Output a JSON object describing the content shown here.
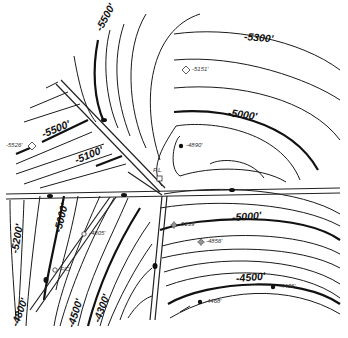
{
  "map": {
    "type": "structure contour map",
    "contour_labels": [
      {
        "id": "c5500-top",
        "text": "-5500'",
        "x": 98,
        "y": 30,
        "rot": -62
      },
      {
        "id": "c5300",
        "text": "-5300'",
        "x": 244,
        "y": 36,
        "rot": 5
      },
      {
        "id": "c5000-top",
        "text": "-5000'",
        "x": 228,
        "y": 112,
        "rot": 8
      },
      {
        "id": "c5500-left",
        "text": "-5500'",
        "x": 42,
        "y": 134,
        "rot": -22
      },
      {
        "id": "c5100",
        "text": "-5100'",
        "x": 75,
        "y": 160,
        "rot": -22
      },
      {
        "id": "c5200",
        "text": "-5200'",
        "x": 14,
        "y": 253,
        "rot": -80
      },
      {
        "id": "c5000-mid",
        "text": "-5000'",
        "x": 57,
        "y": 232,
        "rot": -76
      },
      {
        "id": "c4800",
        "text": "-4800'",
        "x": 14,
        "y": 326,
        "rot": -70
      },
      {
        "id": "c4500-left",
        "text": "-4500'",
        "x": 70,
        "y": 327,
        "rot": -72
      },
      {
        "id": "c4300",
        "text": "-4300'",
        "x": 96,
        "y": 322,
        "rot": -70
      },
      {
        "id": "c5000-right",
        "text": "-5000'",
        "x": 232,
        "y": 217,
        "rot": -4
      },
      {
        "id": "c4500-right",
        "text": "-4500'",
        "x": 236,
        "y": 278,
        "rot": -5
      }
    ],
    "wells": [
      {
        "id": "w5151",
        "symbol": "open-diamond",
        "value": "-5151'",
        "x": 186,
        "y": 70
      },
      {
        "id": "w4890",
        "symbol": "filled-dot",
        "value": "-4890'",
        "x": 181,
        "y": 146
      },
      {
        "id": "w5526",
        "symbol": "open-diamond",
        "value": "-5526'",
        "x": 32,
        "y": 146,
        "label_left": true
      },
      {
        "id": "wPL",
        "symbol": "open-square",
        "value": "P.L.",
        "x": 160,
        "y": 176,
        "label_above": true
      },
      {
        "id": "w4805",
        "symbol": "open-circle",
        "value": "-4805'",
        "x": 84,
        "y": 234
      },
      {
        "id": "wFO",
        "symbol": "open-circle",
        "value": "F/O",
        "x": 55,
        "y": 270
      },
      {
        "id": "w5139",
        "symbol": "dry-hole",
        "value": "-5139'",
        "x": 174,
        "y": 225
      },
      {
        "id": "w4856",
        "symbol": "dry-hole",
        "value": "-4856'",
        "x": 201,
        "y": 242
      },
      {
        "id": "w4468",
        "symbol": "filled-dot",
        "value": "-4468'",
        "x": 200,
        "y": 302
      },
      {
        "id": "w4406",
        "symbol": "filled-dot",
        "value": "-4406'",
        "x": 273,
        "y": 287
      }
    ],
    "faults": [
      {
        "id": "fault-nw",
        "desc": "NW-SE fault from upper-left to P.L."
      },
      {
        "id": "fault-ew",
        "desc": "E-W fault across middle"
      },
      {
        "id": "fault-sw",
        "desc": "SW trending fault"
      },
      {
        "id": "fault-s",
        "desc": "N-S fault in center"
      }
    ]
  }
}
